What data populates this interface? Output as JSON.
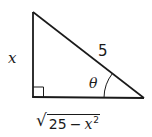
{
  "diagram": {
    "type": "right-triangle",
    "stroke_color": "#1a1a1a",
    "vertices": {
      "top": [
        33,
        12
      ],
      "right_angle": [
        33,
        97
      ],
      "bottom_right": [
        144,
        98
      ]
    },
    "right_angle_marker": true,
    "angle_marker": {
      "vertex": "bottom_right",
      "symbol": "θ"
    },
    "labels": {
      "vertical_side": "x",
      "hypotenuse": "5",
      "angle": "θ",
      "base": {
        "radical_symbol": "√",
        "constant": "25",
        "operator": "−",
        "variable": "x",
        "exponent": "2"
      }
    }
  }
}
